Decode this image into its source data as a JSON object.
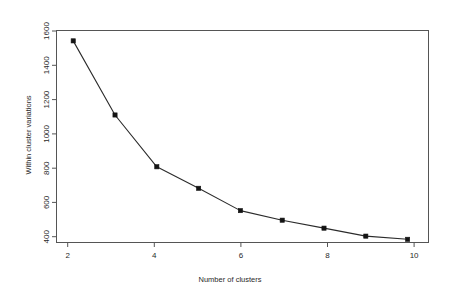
{
  "chart_data": {
    "type": "line",
    "title": "",
    "subtitle": "",
    "xlabel": "Number of clusters",
    "ylabel": "Within cluster variations",
    "x": [
      2,
      3,
      4,
      5,
      6,
      7,
      8,
      9,
      10
    ],
    "values": [
      1575,
      1110,
      785,
      650,
      510,
      450,
      400,
      350,
      330
    ],
    "series": [
      {
        "name": "Within cluster variations",
        "values": [
          1575,
          1110,
          785,
          650,
          510,
          450,
          400,
          350,
          330
        ]
      }
    ],
    "xlim": [
      1.6,
      10.5
    ],
    "ylim": [
      310,
      1640
    ],
    "xticks": [
      2,
      4,
      6,
      8,
      10
    ],
    "xtick_labels": [
      "2",
      "4",
      "6",
      "8",
      "10"
    ],
    "yticks": [
      400,
      600,
      800,
      1000,
      1200,
      1400,
      1600
    ],
    "ytick_labels": [
      "400",
      "600",
      "800",
      "1000",
      "1200",
      "1400",
      "1600"
    ],
    "grid": false,
    "legend": false,
    "legend_position": "none",
    "marker": "filled-square",
    "line_color": "#2b2b2b",
    "marker_color": "#141414",
    "axis_color": "#555555",
    "background_color": "#ffffff",
    "annotations": []
  },
  "axis": {
    "x_title": "Number of clusters",
    "y_title": "Within cluster variations",
    "x_tick_labels": [
      "2",
      "4",
      "6",
      "8",
      "10"
    ],
    "y_tick_labels": [
      "400",
      "600",
      "800",
      "1000",
      "1200",
      "1400",
      "1600"
    ]
  }
}
